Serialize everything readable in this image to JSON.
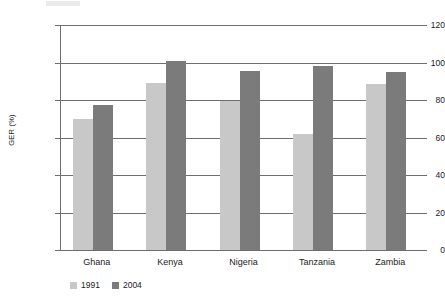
{
  "chart_data": {
    "type": "bar",
    "title": "",
    "subtitle": "",
    "xlabel": "",
    "ylabel": "GER (%)",
    "categories": [
      "Ghana",
      "Kenya",
      "Nigeria",
      "Tanzania",
      "Zambia"
    ],
    "series": [
      {
        "name": "1991",
        "color": "#c8c8c8",
        "values": [
          70,
          89,
          79.5,
          62,
          88.5
        ]
      },
      {
        "name": "2004",
        "color": "#7b7b7b",
        "values": [
          77.5,
          101,
          95.5,
          98,
          95
        ]
      }
    ],
    "ylim": [
      0,
      120
    ],
    "yticks": [
      0,
      20,
      40,
      60,
      80,
      100,
      120
    ],
    "ytick_labels": [
      "0",
      "20",
      "40",
      "60",
      "80",
      "100",
      "120"
    ],
    "grid": true,
    "grid_axis": "y",
    "legend_position": "bottom-left",
    "legend_entries": [
      "1991",
      "2004"
    ]
  },
  "colors": {
    "axis": "#6e6e6e",
    "grid": "#6e6e6e",
    "text": "#1a1a1a",
    "background": "#ffffff",
    "series_1991": "#c8c8c8",
    "series_2004": "#7b7b7b"
  }
}
